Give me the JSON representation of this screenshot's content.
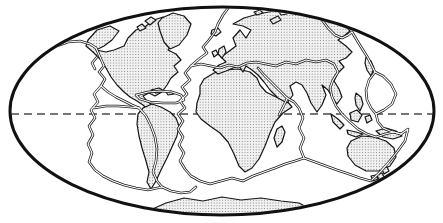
{
  "figure": {
    "type": "map",
    "colors": {
      "background": "#ffffff",
      "frame_stroke": "#111111",
      "land_outline": "#151515",
      "land_dot": "#6e6e6e",
      "land_fill": "#f1f1f1",
      "boundary_casing": "#1a1a1a",
      "boundary_core": "#ffffff",
      "equator_dash": "#4a4a4a"
    }
  },
  "map": {
    "frame": {
      "d": "M 10,111 A 212,104 0 1 1 434,111 A 212,104 0 1 1 10,111 Z"
    },
    "equator": {
      "d": "M 11,114 L 433,114"
    },
    "continents": {
      "north_america": {
        "d": "M 88,40 L 97,30 L 110,26 L 119,31 L 112,40 L 104,46 L 96,50 L 106,52 L 114,50 L 124,46 L 128,38 L 136,30 L 146,26 L 154,20 L 163,17 L 170,22 L 164,28 L 172,32 L 178,38 L 172,44 L 168,50 L 176,54 L 181,60 L 174,66 L 178,72 L 171,78 L 167,85 L 162,92 L 155,96 L 149,93 L 143,96 L 147,101 L 152,105 L 148,110 L 143,105 L 137,101 L 130,97 L 124,92 L 117,85 L 111,77 L 106,68 L 101,60 L 93,52 L 86,46 Z"
      },
      "greenland": {
        "d": "M 162,18 L 173,13 L 184,16 L 191,24 L 187,35 L 179,45 L 170,49 L 164,42 L 160,31 L 158,23 Z"
      },
      "iceland": {
        "d": "M 212,30 L 218,28 L 221,32 L 216,36 L 211,34 Z"
      },
      "arctic_canada_1": {
        "d": "M 145,21 L 151,17 L 156,20 L 150,25 Z"
      },
      "arctic_canada_2": {
        "d": "M 137,27 L 142,24 L 146,28 L 140,31 Z"
      },
      "cuba": {
        "d": "M 151,90 L 159,88 L 164,91 L 156,93 Z"
      },
      "hispaniola": {
        "d": "M 166,92 L 171,91 L 174,94 L 168,95 Z"
      },
      "south_america": {
        "d": "M 143,108 L 152,104 L 161,107 L 170,112 L 176,118 L 179,126 L 177,136 L 172,147 L 167,158 L 161,170 L 156,181 L 151,189 L 147,182 L 149,172 L 146,161 L 142,148 L 139,136 L 137,124 L 138,114 Z"
      },
      "africa": {
        "d": "M 204,79 L 214,73 L 226,70 L 238,69 L 250,72 L 257,78 L 260,85 L 266,92 L 276,97 L 287,101 L 292,107 L 283,113 L 275,122 L 270,133 L 265,146 L 259,159 L 252,168 L 245,172 L 239,166 L 234,154 L 228,142 L 220,133 L 210,126 L 201,119 L 196,112 L 197,103 L 200,94 L 200,86 Z"
      },
      "madagascar": {
        "d": "M 277,129 L 282,126 L 285,132 L 282,142 L 277,147 L 274,138 Z"
      },
      "eurasia": {
        "d": "M 233,24 L 244,18 L 258,14 L 274,11 L 292,11 L 310,13 L 326,17 L 342,22 L 350,31 L 344,36 L 338,40 L 346,46 L 352,52 L 346,58 L 339,61 L 344,67 L 338,73 L 334,81 L 339,89 L 342,97 L 337,104 L 332,97 L 328,90 L 322,85 L 326,95 L 322,105 L 317,112 L 311,103 L 307,93 L 302,85 L 296,82 L 290,86 L 293,95 L 287,103 L 278,98 L 270,90 L 264,82 L 258,75 L 252,70 L 246,66 L 243,72 L 239,66 L 233,68 L 226,71 L 218,74 L 213,70 L 219,65 L 226,62 L 221,57 L 228,52 L 236,46 L 233,38 L 240,30 L 246,38 L 251,30 L 243,26 Z"
      },
      "britain": {
        "d": "M 219,49 L 224,46 L 226,52 L 222,58 L 218,54 Z"
      },
      "ireland": {
        "d": "M 212,52 L 216,50 L 218,54 L 214,57 Z"
      },
      "svalbard": {
        "d": "M 254,12 L 260,10 L 263,13 L 257,15 Z"
      },
      "novaya_zemlya": {
        "d": "M 270,20 L 278,16 L 281,20 L 273,24 Z"
      },
      "franz_josef": {
        "d": "M 279,12 L 285,11 L 287,14 L 281,15 Z"
      },
      "japan": {
        "d": "M 366,57 L 371,61 L 374,68 L 371,76 L 367,70 L 365,63 Z"
      },
      "philippines": {
        "d": "M 356,93 L 361,97 L 363,104 L 360,111 L 356,105 L 355,98 Z"
      },
      "borneo": {
        "d": "M 350,113 L 357,110 L 362,115 L 358,122 L 351,120 Z"
      },
      "sumatra": {
        "d": "M 331,114 L 338,119 L 344,125 L 340,129 L 333,122 Z"
      },
      "java": {
        "d": "M 347,130 L 356,132 L 363,134 L 356,137 L 348,134 Z"
      },
      "sulawesi": {
        "d": "M 365,117 L 370,115 L 372,120 L 367,123 Z"
      },
      "new_guinea": {
        "d": "M 376,131 L 386,128 L 396,131 L 402,136 L 393,139 L 383,137 Z"
      },
      "australia": {
        "d": "M 351,141 L 362,136 L 374,137 L 386,141 L 394,148 L 396,157 L 390,166 L 379,171 L 366,171 L 355,165 L 348,156 L 347,148 Z"
      },
      "tasmania": {
        "d": "M 371,176 L 376,175 L 378,179 L 373,181 Z"
      },
      "new_zealand_north": {
        "d": "M 382,169 L 387,167 L 389,171 L 384,174 Z"
      },
      "new_zealand_south": {
        "d": "M 377,175 L 382,173 L 384,177 L 379,180 Z"
      },
      "antarctica": {
        "d": "M 148,211 L 166,203 L 184,198 L 203,201 L 222,197 L 241,200 L 261,198 L 281,201 L 299,203 L 312,210 L 318,216 L 295,219 L 268,220 L 238,220 L 208,218 L 183,216 L 162,214 Z"
      }
    },
    "boundaries": {
      "mid_atlantic_ridge": {
        "d": "M 229,7 L 223,15 L 218,24 L 215,32 L 209,40 L 203,47 L 207,53 L 199,59 L 191,66 L 185,73 L 190,80 L 182,87 L 187,94 L 180,101 L 185,108 L 178,114 L 183,121 L 178,129 L 183,137 L 179,145 L 184,153 L 180,161 L 185,169 L 191,176 L 200,181 L 210,184 L 221,181 L 232,178 L 243,181 L 253,176 L 264,172 L 275,168 L 285,164 L 295,161 L 304,158 L 315,162 L 326,166 L 337,170 L 349,174 L 360,178 L 371,181"
      },
      "central_indian_ridge": {
        "d": "M 304,158 L 300,148 L 304,138 L 299,128 L 303,118 L 299,108 L 294,102 L 287,98"
      },
      "red_sea_rift": {
        "d": "M 287,98 L 280,91 L 272,83 L 264,75 L 258,68"
      },
      "east_african_rift": {
        "d": "M 287,99 L 283,107 L 279,115"
      },
      "alpine_himalayan_belt": {
        "d": "M 191,66 L 201,64 L 211,66 L 220,68 L 229,65 L 238,67 L 247,63 L 256,62 L 266,64 L 276,66 L 286,62 L 296,64 L 306,60 L 316,62 L 326,60 L 334,64 L 338,72 L 333,80 L 330,88 L 332,97 L 336,106 L 342,114 L 350,122 L 358,129 L 367,134 L 376,137 L 385,134 L 394,132 L 401,134"
      },
      "west_pacific_trench": {
        "d": "M 352,32 L 358,42 L 363,50 L 368,58 L 372,66 L 375,72 L 383,76 L 391,84 L 396,94 L 392,104 L 384,110 L 376,114 L 378,122 L 383,128 L 390,131 L 397,133 L 401,134"
      },
      "philippine_plate_boundary": {
        "d": "M 375,72 L 369,80 L 366,90 L 367,100 L 371,108 L 376,114"
      },
      "northeast_asia_boundary": {
        "d": "M 322,20 L 328,28 L 335,35 L 342,38 L 348,35 L 352,32"
      },
      "tonga_kermadec_trench": {
        "d": "M 401,134 L 408,129 L 405,141 L 397,152 L 389,162 L 381,171 L 372,180"
      },
      "aleutian_trench": {
        "d": "M 57,46 L 68,42 L 80,41 L 90,44 L 96,48"
      },
      "north_america_west_boundary": {
        "d": "M 96,48 L 100,57 L 104,66 L 99,72 L 105,79 L 101,86 L 108,92 L 116,97 L 124,101 L 132,105 L 139,108"
      },
      "juan_de_fuca_ridge": {
        "d": "M 97,57 L 92,63 L 95,69"
      },
      "caribbean_boundary": {
        "d": "M 136,95 L 148,92 L 160,91 L 172,92 L 181,95 L 184,100 L 176,103 L 163,103 L 150,102 L 140,99 Z"
      },
      "peru_chile_trench": {
        "d": "M 139,108 L 146,116 L 151,126 L 155,137 L 157,149 L 156,161 L 153,172 L 157,181 L 162,187"
      },
      "scotia_arc": {
        "d": "M 162,187 L 171,191 L 181,193 L 190,192 L 196,187"
      },
      "east_pacific_rise": {
        "d": "M 101,86 L 94,94 L 98,102 L 91,110 L 95,118 L 89,126 L 93,135 L 88,144 L 92,153 L 89,162 L 95,170 L 103,176 L 113,181 L 124,185 L 136,188 L 148,190 L 162,187"
      },
      "galapagos_ridge": {
        "d": "M 94,108 L 106,106 L 118,106 L 130,107 L 139,108"
      }
    }
  }
}
